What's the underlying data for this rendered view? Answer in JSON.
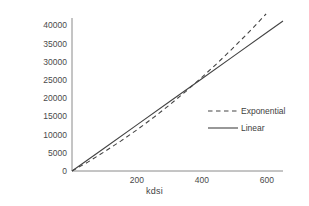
{
  "chart_data": {
    "type": "line",
    "title": "",
    "xlabel": "kdsi",
    "ylabel": "Staff-days",
    "xlim": [
      0,
      650
    ],
    "ylim": [
      0,
      42000
    ],
    "xticks": [
      200,
      400,
      600
    ],
    "xtick_labels": [
      "200",
      "400",
      "600"
    ],
    "yticks": [
      0,
      5000,
      10000,
      15000,
      20000,
      25000,
      30000,
      35000,
      40000
    ],
    "ytick_labels": [
      "0",
      "5000",
      "10000",
      "15000",
      "20000",
      "25000",
      "30000",
      "35000",
      "40000"
    ],
    "grid": false,
    "legend_position": "center right",
    "series": [
      {
        "name": "Exponential",
        "style": "dashed",
        "color": "#444444",
        "x": [
          0,
          50,
          100,
          150,
          200,
          250,
          300,
          350,
          400,
          450,
          500,
          550,
          600,
          650
        ],
        "values": [
          0,
          2500,
          5300,
          8200,
          11300,
          14600,
          18100,
          21800,
          25700,
          29800,
          34100,
          38600,
          43300,
          48200
        ]
      },
      {
        "name": "Linear",
        "style": "solid",
        "color": "#444444",
        "x": [
          0,
          100,
          200,
          300,
          400,
          500,
          600,
          650
        ],
        "values": [
          0,
          6333,
          12667,
          19000,
          25333,
          31667,
          38000,
          41167
        ]
      }
    ]
  },
  "legend": {
    "items": [
      {
        "label": "Exponential",
        "style": "dashed"
      },
      {
        "label": "Linear",
        "style": "solid"
      }
    ]
  },
  "axes": {
    "color": "#8a8a8a"
  }
}
